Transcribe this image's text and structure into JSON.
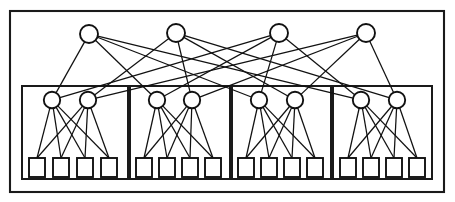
{
  "figure": {
    "kind": "hierarchical-network-diagram",
    "title": "",
    "caption": "",
    "background_color": "#ffffff",
    "line_color": "#111111",
    "frame_color": "#1a1a1a",
    "node_fill": "#ffffff"
  },
  "canvas": {
    "width": 455,
    "height": 202
  },
  "outer_frame": {
    "label": "outer-network-boundary",
    "x": 10,
    "y": 11,
    "width": 434,
    "height": 181
  },
  "layers": {
    "top": {
      "label": "top-layer",
      "shape": "circle",
      "count": 4,
      "radius": 9,
      "cy": 34,
      "nodes": [
        {
          "id": "t1",
          "label": "",
          "cx": 89,
          "cy": 34
        },
        {
          "id": "t2",
          "label": "",
          "cx": 176,
          "cy": 33
        },
        {
          "id": "t3",
          "label": "",
          "cx": 279,
          "cy": 33
        },
        {
          "id": "t4",
          "label": "",
          "cx": 366,
          "cy": 33
        }
      ]
    },
    "hidden": {
      "label": "hidden-layer",
      "shape": "circle",
      "count": 8,
      "radius": 8.2,
      "cy": 100,
      "nodes": [
        {
          "id": "h1",
          "label": "",
          "cx": 52,
          "cy": 100,
          "group": 0
        },
        {
          "id": "h2",
          "label": "",
          "cx": 88,
          "cy": 100,
          "group": 0
        },
        {
          "id": "h3",
          "label": "",
          "cx": 157,
          "cy": 100,
          "group": 1
        },
        {
          "id": "h4",
          "label": "",
          "cx": 192,
          "cy": 100,
          "group": 1
        },
        {
          "id": "h5",
          "label": "",
          "cx": 259,
          "cy": 100,
          "group": 2
        },
        {
          "id": "h6",
          "label": "",
          "cx": 295,
          "cy": 100,
          "group": 2
        },
        {
          "id": "h7",
          "label": "",
          "cx": 361,
          "cy": 100,
          "group": 3
        },
        {
          "id": "h8",
          "label": "",
          "cx": 397,
          "cy": 100,
          "group": 3
        }
      ]
    },
    "input": {
      "label": "input-layer",
      "shape": "square",
      "count": 16,
      "box_width": 16,
      "box_height": 19,
      "top_y": 158,
      "nodes": [
        {
          "id": "s1",
          "label": "",
          "x": 29,
          "y": 158,
          "group": 0
        },
        {
          "id": "s2",
          "label": "",
          "x": 53,
          "y": 158,
          "group": 0
        },
        {
          "id": "s3",
          "label": "",
          "x": 77,
          "y": 158,
          "group": 0
        },
        {
          "id": "s4",
          "label": "",
          "x": 101,
          "y": 158,
          "group": 0
        },
        {
          "id": "s5",
          "label": "",
          "x": 136,
          "y": 158,
          "group": 1
        },
        {
          "id": "s6",
          "label": "",
          "x": 159,
          "y": 158,
          "group": 1
        },
        {
          "id": "s7",
          "label": "",
          "x": 182,
          "y": 158,
          "group": 1
        },
        {
          "id": "s8",
          "label": "",
          "x": 205,
          "y": 158,
          "group": 1
        },
        {
          "id": "s9",
          "label": "",
          "x": 238,
          "y": 158,
          "group": 2
        },
        {
          "id": "s10",
          "label": "",
          "x": 261,
          "y": 158,
          "group": 2
        },
        {
          "id": "s11",
          "label": "",
          "x": 284,
          "y": 158,
          "group": 2
        },
        {
          "id": "s12",
          "label": "",
          "x": 307,
          "y": 158,
          "group": 2
        },
        {
          "id": "s13",
          "label": "",
          "x": 340,
          "y": 158,
          "group": 3
        },
        {
          "id": "s14",
          "label": "",
          "x": 363,
          "y": 158,
          "group": 3
        },
        {
          "id": "s15",
          "label": "",
          "x": 386,
          "y": 158,
          "group": 3
        },
        {
          "id": "s16",
          "label": "",
          "x": 409,
          "y": 158,
          "group": 3
        }
      ]
    }
  },
  "groups": [
    {
      "id": "g1",
      "label": "",
      "x": 22,
      "y": 86,
      "width": 106,
      "height": 93
    },
    {
      "id": "g2",
      "label": "",
      "x": 130,
      "y": 86,
      "width": 100,
      "height": 93
    },
    {
      "id": "g3",
      "label": "",
      "x": 232,
      "y": 86,
      "width": 99,
      "height": 93
    },
    {
      "id": "g4",
      "label": "",
      "x": 333,
      "y": 86,
      "width": 99,
      "height": 93
    }
  ],
  "edges": {
    "top_to_hidden": {
      "label": "top-to-hidden-edges",
      "description": "Each top node connects to exactly one hidden node in every group, producing a crossing bipartite pattern.",
      "count": 16,
      "pairs": [
        [
          "t1",
          "h1"
        ],
        [
          "t1",
          "h3"
        ],
        [
          "t1",
          "h5"
        ],
        [
          "t1",
          "h7"
        ],
        [
          "t2",
          "h2"
        ],
        [
          "t2",
          "h4"
        ],
        [
          "t2",
          "h6"
        ],
        [
          "t2",
          "h8"
        ],
        [
          "t3",
          "h1"
        ],
        [
          "t3",
          "h3"
        ],
        [
          "t3",
          "h5"
        ],
        [
          "t3",
          "h7"
        ],
        [
          "t4",
          "h2"
        ],
        [
          "t4",
          "h4"
        ],
        [
          "t4",
          "h6"
        ],
        [
          "t4",
          "h8"
        ]
      ]
    },
    "hidden_to_input": {
      "label": "hidden-to-input-edges",
      "description": "Within each group both hidden nodes connect to all four input squares (fully connected).",
      "count": 32,
      "pairs": [
        [
          "h1",
          "s1"
        ],
        [
          "h1",
          "s2"
        ],
        [
          "h1",
          "s3"
        ],
        [
          "h1",
          "s4"
        ],
        [
          "h2",
          "s1"
        ],
        [
          "h2",
          "s2"
        ],
        [
          "h2",
          "s3"
        ],
        [
          "h2",
          "s4"
        ],
        [
          "h3",
          "s5"
        ],
        [
          "h3",
          "s6"
        ],
        [
          "h3",
          "s7"
        ],
        [
          "h3",
          "s8"
        ],
        [
          "h4",
          "s5"
        ],
        [
          "h4",
          "s6"
        ],
        [
          "h4",
          "s7"
        ],
        [
          "h4",
          "s8"
        ],
        [
          "h5",
          "s9"
        ],
        [
          "h5",
          "s10"
        ],
        [
          "h5",
          "s11"
        ],
        [
          "h5",
          "s12"
        ],
        [
          "h6",
          "s9"
        ],
        [
          "h6",
          "s10"
        ],
        [
          "h6",
          "s11"
        ],
        [
          "h6",
          "s12"
        ],
        [
          "h7",
          "s13"
        ],
        [
          "h7",
          "s14"
        ],
        [
          "h7",
          "s15"
        ],
        [
          "h7",
          "s16"
        ],
        [
          "h8",
          "s13"
        ],
        [
          "h8",
          "s14"
        ],
        [
          "h8",
          "s15"
        ],
        [
          "h8",
          "s16"
        ]
      ]
    }
  }
}
